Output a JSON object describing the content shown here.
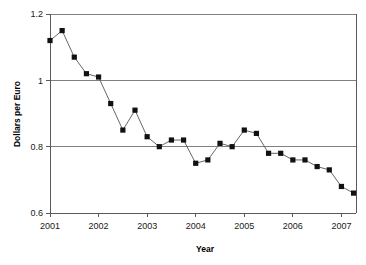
{
  "chart_data": {
    "type": "line",
    "title": "",
    "xlabel": "Year",
    "ylabel": "Dollars per Euro",
    "xlim": [
      2001.0,
      2007.3
    ],
    "ylim": [
      0.6,
      1.2
    ],
    "grid": true,
    "legend": false,
    "legend_position": "none",
    "marker": "square",
    "x_tick_labels": [
      "2001",
      "2002",
      "2003",
      "2004",
      "2005",
      "2006",
      "2007"
    ],
    "x_tick_values": [
      2001,
      2002,
      2003,
      2004,
      2005,
      2006,
      2007
    ],
    "y_tick_labels": [
      "0.6",
      "0.8",
      "1",
      "1.2"
    ],
    "y_tick_values": [
      0.6,
      0.8,
      1.0,
      1.2
    ],
    "gridline_values": [
      0.8,
      1.0,
      1.2
    ],
    "series": [
      {
        "name": "Dollars per Euro",
        "x": [
          2001.0,
          2001.25,
          2001.5,
          2001.75,
          2002.0,
          2002.25,
          2002.5,
          2002.75,
          2003.0,
          2003.25,
          2003.5,
          2003.75,
          2004.0,
          2004.25,
          2004.5,
          2004.75,
          2005.0,
          2005.25,
          2005.5,
          2005.75,
          2006.0,
          2006.25,
          2006.5,
          2006.75,
          2007.0,
          2007.25
        ],
        "values": [
          1.12,
          1.15,
          1.07,
          1.02,
          1.01,
          0.93,
          0.85,
          0.91,
          0.83,
          0.8,
          0.82,
          0.82,
          0.75,
          0.76,
          0.81,
          0.8,
          0.85,
          0.84,
          0.78,
          0.78,
          0.76,
          0.76,
          0.74,
          0.73,
          0.68,
          0.66
        ]
      }
    ]
  },
  "labels": {
    "x_axis_title": "Year",
    "y_axis_title": "Dollars per Euro"
  }
}
